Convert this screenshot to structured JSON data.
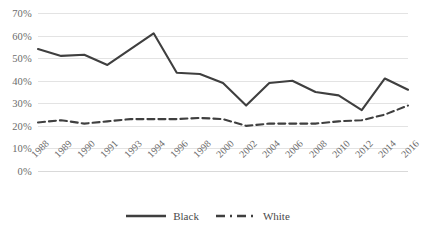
{
  "chart_data": {
    "type": "line",
    "title": "",
    "xlabel": "",
    "ylabel": "",
    "ylim": [
      0,
      70
    ],
    "ytick_step": 10,
    "grid": true,
    "legend_position": "bottom",
    "categories": [
      "1988",
      "1989",
      "1990",
      "1991",
      "1993",
      "1994",
      "1996",
      "1998",
      "2000",
      "2002",
      "2004",
      "2006",
      "2008",
      "2010",
      "2012",
      "2014",
      "2016"
    ],
    "ytick_labels": [
      "70%",
      "60%",
      "50%",
      "40%",
      "30%",
      "20%",
      "10%",
      "0%"
    ],
    "ytick_values": [
      70,
      60,
      50,
      40,
      30,
      20,
      10,
      0
    ],
    "series": [
      {
        "name": "Black",
        "style": "solid",
        "color": "#3f3f3f",
        "values": [
          54,
          51,
          51.5,
          47,
          54,
          61,
          43.5,
          43,
          39,
          29,
          39,
          40,
          35,
          33.5,
          27,
          41,
          36
        ]
      },
      {
        "name": "White",
        "style": "dashed",
        "color": "#3f3f3f",
        "values": [
          21.5,
          22.5,
          21,
          22,
          23,
          23,
          23,
          23.5,
          23,
          20,
          21,
          21,
          21,
          22,
          22.5,
          25,
          29
        ]
      }
    ]
  },
  "colors": {
    "line": "#3f3f3f",
    "grid": "#e3e3e3",
    "tick_text": "#6b6b6b",
    "legend_text": "#4a4a4a",
    "background": "#ffffff"
  },
  "legend": {
    "items": [
      {
        "label": "Black",
        "style": "solid"
      },
      {
        "label": "White",
        "style": "dashed"
      }
    ]
  }
}
